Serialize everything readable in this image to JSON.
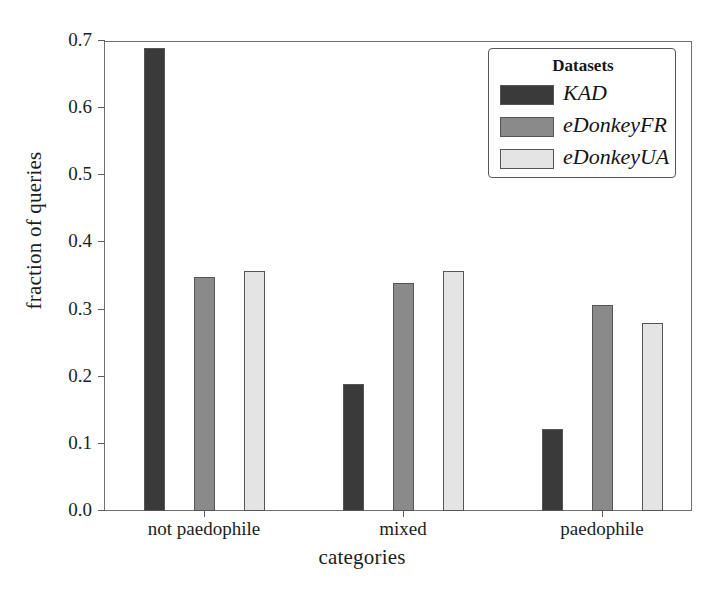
{
  "chart_data": {
    "type": "bar",
    "title": "",
    "xlabel": "categories",
    "ylabel": "fraction of queries",
    "categories": [
      "not paedophile",
      "mixed",
      "paedophile"
    ],
    "series": [
      {
        "name": "KAD",
        "values": [
          0.69,
          0.189,
          0.122
        ],
        "color": "#3a3a3a"
      },
      {
        "name": "eDonkeyFR",
        "values": [
          0.349,
          0.339,
          0.307
        ],
        "color": "#8a8a8a"
      },
      {
        "name": "eDonkeyUA",
        "values": [
          0.358,
          0.357,
          0.28
        ],
        "color": "#e4e4e4"
      }
    ],
    "ylim": [
      0.0,
      0.7
    ],
    "ytick_labels": [
      "0.0",
      "0.1",
      "0.2",
      "0.3",
      "0.4",
      "0.5",
      "0.6",
      "0.7"
    ],
    "ytick_values": [
      0.0,
      0.1,
      0.2,
      0.3,
      0.4,
      0.5,
      0.6,
      0.7
    ],
    "grid": false,
    "legend_position": "upper right"
  },
  "legend": {
    "title": "Datasets",
    "entries": [
      "KAD",
      "eDonkeyFR",
      "eDonkeyUA"
    ]
  },
  "axes": {
    "ylabel": "fraction of queries",
    "xlabel": "categories"
  }
}
